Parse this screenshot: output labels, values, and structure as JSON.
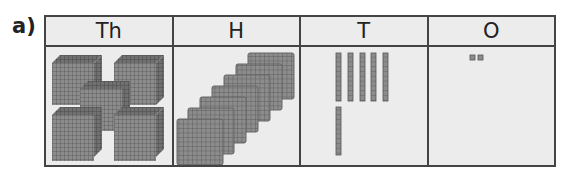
{
  "question": {
    "label": "a)"
  },
  "place_value_chart": {
    "headers": [
      "Th",
      "H",
      "T",
      "O"
    ],
    "columns": [
      {
        "header": "Th",
        "block_type": "thousand-cube",
        "count": 5
      },
      {
        "header": "H",
        "block_type": "hundred-flat",
        "count": 7
      },
      {
        "header": "T",
        "block_type": "ten-rod",
        "count": 6
      },
      {
        "header": "O",
        "block_type": "one-cube",
        "count": 2
      }
    ],
    "represented_number": "5762"
  },
  "colors": {
    "block_fill": "#8c8c8c",
    "block_grid": "#555555",
    "cell_bg": "#ececec",
    "border": "#444444"
  }
}
